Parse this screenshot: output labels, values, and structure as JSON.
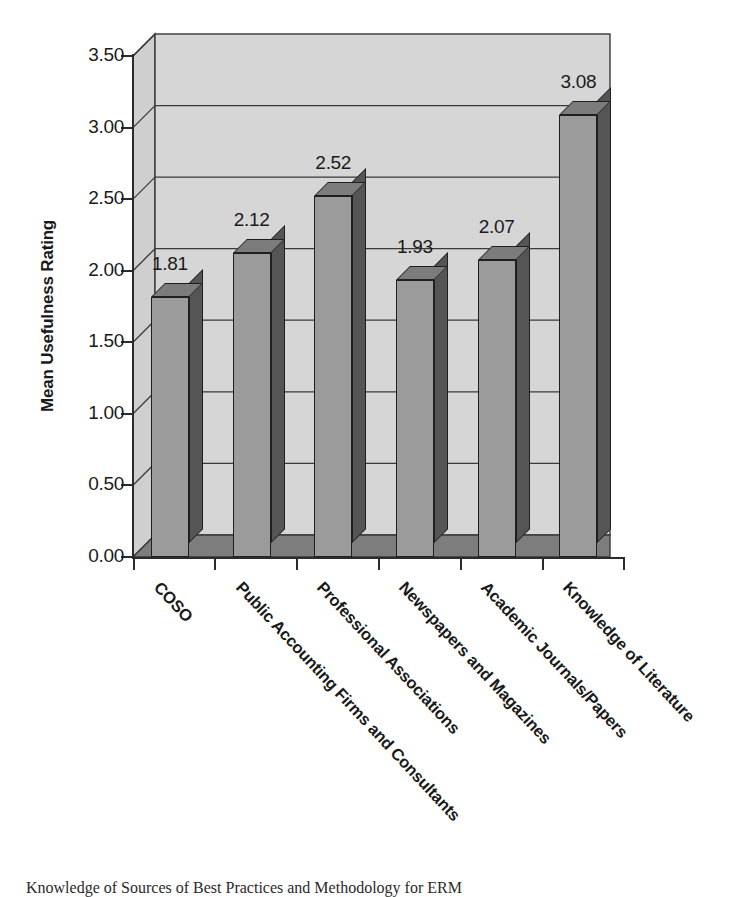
{
  "chart_data": {
    "type": "bar",
    "title": "",
    "subtitle": "",
    "xlabel": "",
    "ylabel": "Mean Usefulness Rating",
    "ylim": [
      0.0,
      3.5
    ],
    "ytick_labels": [
      "0.00",
      "0.50",
      "1.00",
      "1.50",
      "2.00",
      "2.50",
      "3.00",
      "3.50"
    ],
    "ytick_values": [
      0.0,
      0.5,
      1.0,
      1.5,
      2.0,
      2.5,
      3.0,
      3.5
    ],
    "grid": "horizontal",
    "legend": "none",
    "style": "3d-column",
    "categories": [
      "COSO",
      "Public Accounting Firms and Consultants",
      "Professional Associations",
      "Newspapers and Magazines",
      "Academic Journals/Papers",
      "Knowledge of Literature"
    ],
    "values": [
      1.81,
      2.12,
      2.52,
      1.93,
      2.07,
      3.08
    ],
    "value_labels": [
      "1.81",
      "2.12",
      "2.52",
      "1.93",
      "2.07",
      "3.08"
    ]
  },
  "caption": {
    "text": "Knowledge of Sources of Best Practices and Methodology for ERM"
  },
  "colors": {
    "bar_front": "#9b9b9b",
    "bar_side": "#555555",
    "bar_top": "#7c7c7c",
    "wall_back": "#d4d4d4",
    "wall_side": "#cccccc",
    "floor": "#7d7d7d",
    "axis": "#2b2b2b",
    "text": "#1a1a1a"
  }
}
